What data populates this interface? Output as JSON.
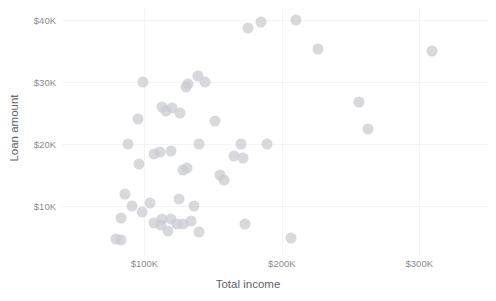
{
  "chart_data": {
    "type": "scatter",
    "title": "",
    "xlabel": "Total income",
    "ylabel": "Loan amount",
    "xlim": [
      40000,
      350000
    ],
    "ylim": [
      2000,
      42000
    ],
    "grid": true,
    "legend": null,
    "x_tick_labels": [
      "$100K",
      "$200K",
      "$300K"
    ],
    "x_tick_values": [
      100000,
      200000,
      300000
    ],
    "y_tick_labels": [
      "$10K",
      "$20K",
      "$30K",
      "$40K"
    ],
    "y_tick_values": [
      10000,
      20000,
      30000,
      40000
    ],
    "point_color": "#c9cbd0",
    "series": [
      {
        "name": "loans",
        "points": [
          [
            185000,
            39800
          ],
          [
            175000,
            38700
          ],
          [
            210000,
            40000
          ],
          [
            226000,
            35400
          ],
          [
            309000,
            35100
          ],
          [
            139000,
            31100
          ],
          [
            144000,
            30000
          ],
          [
            99000,
            30000
          ],
          [
            132000,
            29700
          ],
          [
            130000,
            29200
          ],
          [
            256000,
            26900
          ],
          [
            113000,
            26000
          ],
          [
            120000,
            25800
          ],
          [
            116000,
            25400
          ],
          [
            126000,
            25000
          ],
          [
            95000,
            24100
          ],
          [
            151000,
            23800
          ],
          [
            263000,
            22500
          ],
          [
            88000,
            20000
          ],
          [
            170000,
            20100
          ],
          [
            140000,
            20100
          ],
          [
            189000,
            20000
          ],
          [
            119000,
            19000
          ],
          [
            111000,
            18800
          ],
          [
            107000,
            18400
          ],
          [
            165000,
            18200
          ],
          [
            172000,
            17800
          ],
          [
            96000,
            16900
          ],
          [
            131000,
            16200
          ],
          [
            128000,
            15800
          ],
          [
            155000,
            15100
          ],
          [
            158000,
            14300
          ],
          [
            86000,
            12000
          ],
          [
            125000,
            11200
          ],
          [
            104000,
            10500
          ],
          [
            91000,
            10000
          ],
          [
            136000,
            10000
          ],
          [
            98000,
            9100
          ],
          [
            83000,
            8200
          ],
          [
            113000,
            8000
          ],
          [
            119000,
            7900
          ],
          [
            134000,
            7700
          ],
          [
            107000,
            7400
          ],
          [
            124000,
            7200
          ],
          [
            128000,
            7100
          ],
          [
            112000,
            7000
          ],
          [
            173000,
            7100
          ],
          [
            117000,
            6000
          ],
          [
            140000,
            5900
          ],
          [
            79000,
            4700
          ],
          [
            83000,
            4600
          ],
          [
            207000,
            4900
          ]
        ]
      }
    ]
  }
}
